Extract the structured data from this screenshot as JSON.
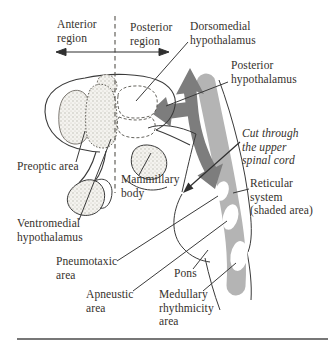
{
  "figure": {
    "type": "anatomical-diagram"
  },
  "colors": {
    "background": "#ffffff",
    "line": "#3a3a3a",
    "text": "#35312c",
    "flow_arrow": "#7d7d7d",
    "reticular_shading": "#b4b4b4",
    "stipple_dot": "#b9b6ae",
    "bottom_rule": "#4a4a4a"
  },
  "icons": {
    "flow_arrow": "branching thick gray arrow (up + toward hypothalamus + down spinal cord)",
    "extent_arrow": "double-headed horizontal arrow",
    "cut_arrow": "thin leader with solid arrowhead",
    "divider": "vertical dashed line separating anterior / posterior regions"
  },
  "labels": {
    "anterior_region": {
      "text": "Anterior\nregion"
    },
    "posterior_region": {
      "text": "Posterior\nregion"
    },
    "dorsomedial_hypothalamus": {
      "text": "Dorsomedial\nhypothalamus"
    },
    "posterior_hypothalamus": {
      "text": "Posterior\nhypothalamus"
    },
    "cut_note": {
      "text": "Cut through\nthe upper\nspinal cord",
      "style": "italic"
    },
    "preoptic_area": {
      "text": "Preoptic area"
    },
    "mammillary_body": {
      "text": "Mammillary\nbody"
    },
    "reticular_system": {
      "text": "Reticular\nsystem\n(shaded area)"
    },
    "ventromedial_hypothalamus": {
      "text": "Ventromedial\nhypothalamus"
    },
    "pneumotaxic_area": {
      "text": "Pneumotaxic\narea"
    },
    "pons": {
      "text": "Pons"
    },
    "apneustic_area": {
      "text": "Apneustic\narea"
    },
    "medullary_rhythmicity_area": {
      "text": "Medullary\nrhythmicity\narea"
    }
  }
}
